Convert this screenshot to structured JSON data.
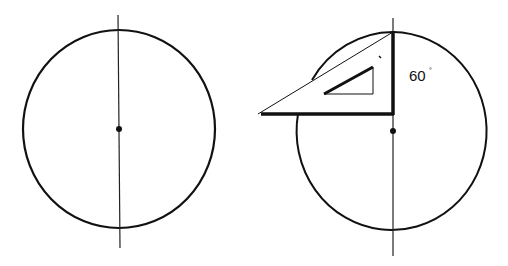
{
  "figures": [
    {
      "id": "left",
      "description": "Circle with vertical center line and center point",
      "circle": {
        "cx": 119,
        "cy": 129,
        "rx": 96,
        "ry": 99
      },
      "center_line": {
        "x1": 118,
        "y1": 15,
        "x2": 120,
        "y2": 248
      },
      "center_dot": {
        "cx": 119,
        "cy": 129,
        "r": 3
      }
    },
    {
      "id": "right",
      "description": "Circle with vertical center line and a 30-60-90 set square placed at the top of the center line",
      "circle": {
        "cx": 393,
        "cy": 131,
        "rx": 95,
        "ry": 99
      },
      "center_line": {
        "x1": 393,
        "y1": 18,
        "x2": 393,
        "y2": 256
      },
      "center_dot": {
        "cx": 393,
        "cy": 131,
        "r": 3
      },
      "set_square": {
        "outer_vertices": [
          [
            393,
            32
          ],
          [
            393,
            114
          ],
          [
            258,
            114
          ]
        ],
        "inner_vertices": [
          [
            373,
            67
          ],
          [
            373,
            94
          ],
          [
            324,
            94
          ]
        ]
      },
      "angle_label": {
        "value": "60",
        "unit": "°"
      }
    }
  ],
  "colors": {
    "stroke": "#111111",
    "background": "#ffffff"
  }
}
